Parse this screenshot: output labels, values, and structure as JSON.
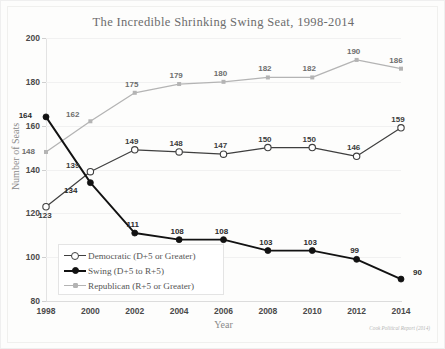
{
  "chart_data": {
    "type": "line",
    "title": "The Incredible Shrinking Swing Seat, 1998-2014",
    "xlabel": "Year",
    "ylabel": "Number of Seats",
    "categories": [
      1998,
      2000,
      2002,
      2004,
      2006,
      2008,
      2010,
      2012,
      2014
    ],
    "x_tick_labels": [
      "1998",
      "2000",
      "2002",
      "2004",
      "2006",
      "2008",
      "2010",
      "2012",
      "2014"
    ],
    "y_tick_labels": [
      "200",
      "180",
      "160",
      "140",
      "120",
      "100",
      "80"
    ],
    "ylim": [
      80,
      200
    ],
    "y_step": 20,
    "grid": true,
    "legend_position": "inside-lower-left",
    "source_note": "Cook Political Report (2014)",
    "series": [
      {
        "name": "Democratic (D+5 or Greater)",
        "color": "#3f3f3f",
        "marker": "open-circle",
        "values": [
          123,
          139,
          149,
          148,
          147,
          150,
          150,
          146,
          159
        ],
        "labels": [
          "123",
          "139",
          "149",
          "148",
          "147",
          "150",
          "150",
          "146",
          "159"
        ]
      },
      {
        "name": "Swing (D+5 to R+5)",
        "color": "#121212",
        "marker": "filled-circle",
        "values": [
          164,
          134,
          111,
          108,
          108,
          103,
          103,
          99,
          90
        ],
        "labels": [
          "164",
          "134",
          "111",
          "108",
          "108",
          "103",
          "103",
          "99",
          "90"
        ]
      },
      {
        "name": "Republican (R+5 or Greater)",
        "color": "#b4b4b4",
        "marker": "small-square",
        "values": [
          148,
          162,
          175,
          179,
          180,
          182,
          182,
          190,
          186
        ],
        "labels": [
          "148",
          "162",
          "175",
          "179",
          "180",
          "182",
          "182",
          "190",
          "186"
        ]
      }
    ]
  },
  "legend": {
    "items": [
      "Democratic (D+5 or Greater)",
      "Swing (D+5 to R+5)",
      "Republican (R+5 or Greater)"
    ]
  }
}
